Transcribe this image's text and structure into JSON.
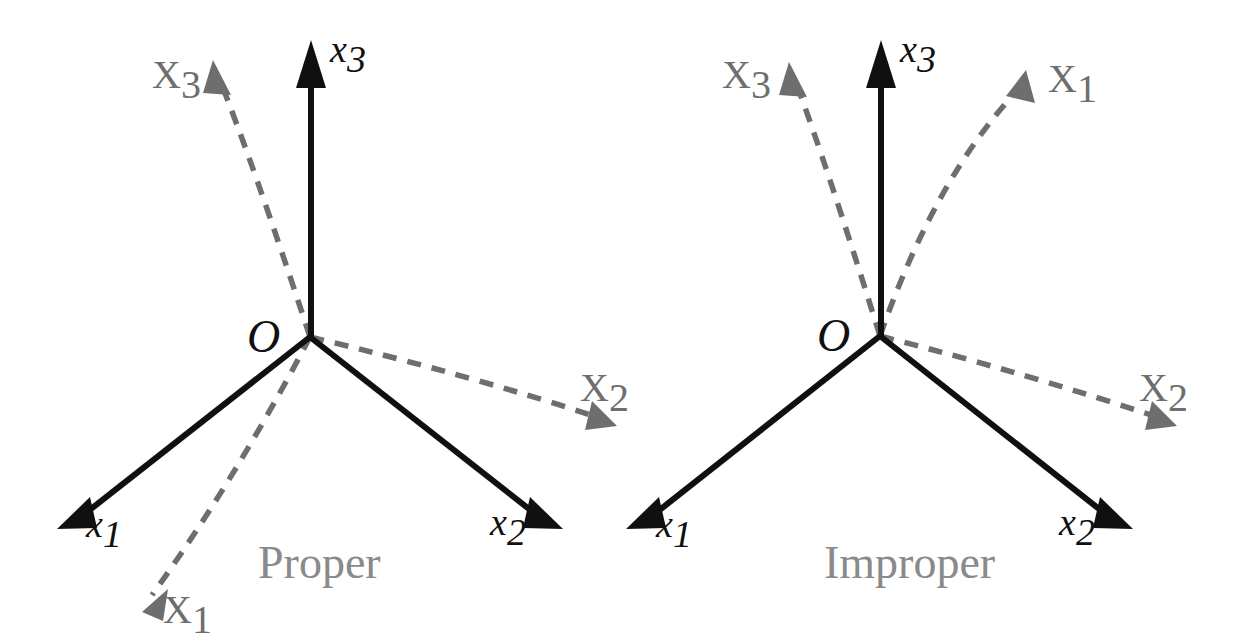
{
  "figure": {
    "background_color": "#ffffff",
    "solid_axis_color": "#101010",
    "dashed_axis_color": "#6e6e6e",
    "caption_color": "#8a8a8a"
  },
  "panels": [
    {
      "id": "proper",
      "caption": "Proper",
      "origin_label": "O",
      "origin": {
        "x": 310,
        "y": 337
      },
      "solid_axes": [
        {
          "name": "x3",
          "base": "x",
          "sub": "3",
          "label_x": 330,
          "label_y": 62,
          "tip": {
            "x": 311,
            "y": 40
          },
          "tail": {
            "x": 311,
            "y": 337
          }
        },
        {
          "name": "x1",
          "base": "x",
          "sub": "1",
          "label_x": 86,
          "label_y": 537,
          "tip": {
            "x": 57,
            "y": 529
          },
          "tail": {
            "x": 310,
            "y": 337
          }
        },
        {
          "name": "x2",
          "base": "x",
          "sub": "2",
          "label_x": 490,
          "label_y": 535,
          "tip": {
            "x": 563,
            "y": 530
          },
          "tail": {
            "x": 310,
            "y": 337
          }
        }
      ],
      "dashed_axes": [
        {
          "name": "X3",
          "base": "X",
          "sub": "3",
          "label_x": 152,
          "label_y": 88,
          "tip": {
            "x": 213,
            "y": 60
          },
          "tail": {
            "x": 310,
            "y": 337
          },
          "control": {
            "x": 253,
            "y": 163
          }
        },
        {
          "name": "X1",
          "base": "X",
          "sub": "1",
          "label_x": 163,
          "label_y": 623,
          "tip": {
            "x": 142,
            "y": 612
          },
          "tail": {
            "x": 310,
            "y": 337
          },
          "control": {
            "x": 235,
            "y": 480
          }
        },
        {
          "name": "X2",
          "base": "X",
          "sub": "2",
          "label_x": 580,
          "label_y": 401,
          "tip": {
            "x": 617,
            "y": 426
          },
          "tail": {
            "x": 310,
            "y": 337
          },
          "control": {
            "x": 470,
            "y": 375
          }
        }
      ],
      "caption_x": 258,
      "caption_y": 578
    },
    {
      "id": "improper",
      "caption": "Improper",
      "origin_label": "O",
      "origin": {
        "x": 880,
        "y": 336
      },
      "solid_axes": [
        {
          "name": "x3",
          "base": "x",
          "sub": "3",
          "label_x": 900,
          "label_y": 62,
          "tip": {
            "x": 881,
            "y": 40
          },
          "tail": {
            "x": 881,
            "y": 336
          }
        },
        {
          "name": "x1",
          "base": "x",
          "sub": "1",
          "label_x": 656,
          "label_y": 537,
          "tip": {
            "x": 626,
            "y": 529
          },
          "tail": {
            "x": 880,
            "y": 336
          }
        },
        {
          "name": "x2",
          "base": "x",
          "sub": "2",
          "label_x": 1059,
          "label_y": 535,
          "tip": {
            "x": 1133,
            "y": 530
          },
          "tail": {
            "x": 880,
            "y": 336
          }
        }
      ],
      "dashed_axes": [
        {
          "name": "X3",
          "base": "X",
          "sub": "3",
          "label_x": 722,
          "label_y": 88,
          "tip": {
            "x": 789,
            "y": 62
          },
          "tail": {
            "x": 880,
            "y": 336
          },
          "control": {
            "x": 826,
            "y": 163
          }
        },
        {
          "name": "X1",
          "base": "X",
          "sub": "1",
          "label_x": 1048,
          "label_y": 92,
          "tip": {
            "x": 1026,
            "y": 70
          },
          "tail": {
            "x": 880,
            "y": 336
          },
          "control": {
            "x": 936,
            "y": 176
          }
        },
        {
          "name": "X2",
          "base": "X",
          "sub": "2",
          "label_x": 1139,
          "label_y": 401,
          "tip": {
            "x": 1177,
            "y": 426
          },
          "tail": {
            "x": 880,
            "y": 336
          },
          "control": {
            "x": 1032,
            "y": 375
          }
        }
      ],
      "caption_x": 824,
      "caption_y": 578
    }
  ]
}
